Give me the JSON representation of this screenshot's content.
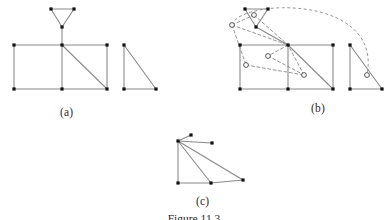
{
  "figure": {
    "caption": "Figure 11.3",
    "panels": [
      {
        "id": "a",
        "label": "(a)"
      },
      {
        "id": "b",
        "label": "(b)"
      },
      {
        "id": "c",
        "label": "(c)"
      }
    ]
  },
  "style": {
    "edge_color": "#8a8a8a",
    "edge_color_dark": "#6f6f6f",
    "node_fill": "#111111",
    "dashed_color": "#8a8a8a",
    "open_node_stroke": "#444444",
    "background": "#ffffff",
    "node_size": 3.2,
    "open_node_radius": 2.4,
    "edge_width": 1.1,
    "dash_pattern": "3,2.5"
  },
  "chart_data": {
    "type": "diagram",
    "title": "Figure 11.3",
    "panels": [
      {
        "id": "a",
        "label": "(a)",
        "components": [
          {
            "name": "top-triangle",
            "nodes": [
              {
                "id": "t1",
                "x": 51,
                "y": 9,
                "type": "filled"
              },
              {
                "id": "t2",
                "x": 74,
                "y": 9,
                "type": "filled"
              },
              {
                "id": "t3",
                "x": 62,
                "y": 27,
                "type": "filled"
              }
            ],
            "edges": [
              [
                "t1",
                "t2"
              ],
              [
                "t1",
                "t3"
              ],
              [
                "t2",
                "t3"
              ]
            ]
          },
          {
            "name": "main-grid",
            "nodes": [
              {
                "id": "g1",
                "x": 14,
                "y": 45,
                "type": "filled"
              },
              {
                "id": "g2",
                "x": 62,
                "y": 45,
                "type": "filled"
              },
              {
                "id": "g3",
                "x": 107,
                "y": 45,
                "type": "filled"
              },
              {
                "id": "g4",
                "x": 14,
                "y": 89,
                "type": "filled"
              },
              {
                "id": "g5",
                "x": 62,
                "y": 89,
                "type": "filled"
              },
              {
                "id": "g6",
                "x": 107,
                "y": 89,
                "type": "filled"
              }
            ],
            "edges": [
              [
                "t3",
                "g2"
              ],
              [
                "g1",
                "g2"
              ],
              [
                "g2",
                "g3"
              ],
              [
                "g1",
                "g4"
              ],
              [
                "g2",
                "g5"
              ],
              [
                "g3",
                "g6"
              ],
              [
                "g4",
                "g5"
              ],
              [
                "g5",
                "g6"
              ],
              [
                "g2",
                "g6"
              ]
            ]
          },
          {
            "name": "right-triangle",
            "nodes": [
              {
                "id": "r1",
                "x": 124,
                "y": 45,
                "type": "filled"
              },
              {
                "id": "r2",
                "x": 124,
                "y": 89,
                "type": "filled"
              },
              {
                "id": "r3",
                "x": 156,
                "y": 89,
                "type": "filled"
              }
            ],
            "edges": [
              [
                "r1",
                "r2"
              ],
              [
                "r2",
                "r3"
              ],
              [
                "r1",
                "r3"
              ]
            ]
          }
        ]
      },
      {
        "id": "b",
        "label": "(b)",
        "components": [
          {
            "name": "top-triangle",
            "nodes": [
              {
                "id": "T1",
                "x": 245,
                "y": 9,
                "type": "filled"
              },
              {
                "id": "T2",
                "x": 268,
                "y": 9,
                "type": "filled"
              },
              {
                "id": "T3",
                "x": 256,
                "y": 27,
                "type": "filled"
              }
            ],
            "edges": [
              [
                "T1",
                "T2"
              ],
              [
                "T1",
                "T3"
              ],
              [
                "T2",
                "T3"
              ]
            ]
          },
          {
            "name": "main-grid",
            "nodes": [
              {
                "id": "G1",
                "x": 240,
                "y": 45,
                "type": "filled"
              },
              {
                "id": "G2",
                "x": 288,
                "y": 45,
                "type": "filled"
              },
              {
                "id": "G3",
                "x": 333,
                "y": 45,
                "type": "filled"
              },
              {
                "id": "G4",
                "x": 240,
                "y": 89,
                "type": "filled"
              },
              {
                "id": "G5",
                "x": 288,
                "y": 89,
                "type": "filled"
              },
              {
                "id": "G6",
                "x": 333,
                "y": 89,
                "type": "filled"
              }
            ],
            "edges": [
              [
                "T3",
                "G2"
              ],
              [
                "G1",
                "G2"
              ],
              [
                "G2",
                "G3"
              ],
              [
                "G1",
                "G4"
              ],
              [
                "G2",
                "G5"
              ],
              [
                "G3",
                "G6"
              ],
              [
                "G4",
                "G5"
              ],
              [
                "G5",
                "G6"
              ],
              [
                "G2",
                "G6"
              ]
            ]
          },
          {
            "name": "right-triangle",
            "nodes": [
              {
                "id": "R1",
                "x": 350,
                "y": 45,
                "type": "filled"
              },
              {
                "id": "R2",
                "x": 350,
                "y": 89,
                "type": "filled"
              },
              {
                "id": "R3",
                "x": 382,
                "y": 89,
                "type": "filled"
              }
            ],
            "edges": [
              [
                "R1",
                "R2"
              ],
              [
                "R2",
                "R3"
              ],
              [
                "R1",
                "R3"
              ]
            ]
          },
          {
            "name": "embedding-overlay",
            "style": "dashed",
            "nodes": [
              {
                "id": "p1",
                "x": 254,
                "y": 15,
                "type": "open"
              },
              {
                "id": "p2",
                "x": 232,
                "y": 25,
                "type": "open"
              },
              {
                "id": "p3",
                "x": 268,
                "y": 56,
                "type": "open"
              },
              {
                "id": "p4",
                "x": 246,
                "y": 65,
                "type": "open"
              },
              {
                "id": "p5",
                "x": 304,
                "y": 75,
                "type": "open"
              },
              {
                "id": "p6",
                "x": 367,
                "y": 75,
                "type": "open"
              }
            ],
            "edges": [
              [
                "p2",
                "p1"
              ],
              [
                "p2",
                "G2"
              ],
              [
                "p2",
                "p4"
              ],
              [
                "p1",
                "G2"
              ],
              [
                "p4",
                "p5"
              ],
              [
                "p5",
                "G2"
              ],
              [
                "G2",
                "p3"
              ],
              [
                "p3",
                "p5"
              ],
              [
                "p2",
                "p6"
              ]
            ]
          }
        ]
      },
      {
        "id": "c",
        "label": "(c)",
        "components": [
          {
            "name": "pattern-graph",
            "nodes": [
              {
                "id": "c1",
                "x": 191,
                "y": 135,
                "type": "filled"
              },
              {
                "id": "c2",
                "x": 212,
                "y": 143,
                "type": "filled"
              },
              {
                "id": "c3",
                "x": 178,
                "y": 141,
                "type": "filled"
              },
              {
                "id": "c4",
                "x": 178,
                "y": 183,
                "type": "filled"
              },
              {
                "id": "c5",
                "x": 211,
                "y": 183,
                "type": "filled"
              },
              {
                "id": "c6",
                "x": 243,
                "y": 180,
                "type": "filled"
              }
            ],
            "edges": [
              [
                "c3",
                "c1"
              ],
              [
                "c3",
                "c2"
              ],
              [
                "c3",
                "c4"
              ],
              [
                "c3",
                "c5"
              ],
              [
                "c3",
                "c6"
              ],
              [
                "c4",
                "c5"
              ],
              [
                "c5",
                "c6"
              ]
            ]
          }
        ]
      }
    ]
  }
}
